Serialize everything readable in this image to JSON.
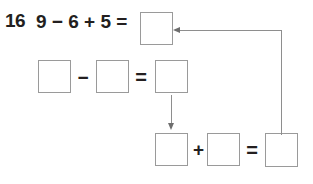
{
  "problem": {
    "number": "16",
    "equation_text": "9 − 6 + 5 =",
    "equation_plain": "9-6+5=",
    "operands": [
      9,
      6,
      5
    ],
    "operators": [
      "−",
      "+"
    ],
    "box_color": "#9a9a9a",
    "ink_color": "#231f20",
    "connector_color": "#8e8e8e"
  },
  "row1": {
    "label": "top-equation-row",
    "answer_box_value": "",
    "answer_box_placeholder": ""
  },
  "row2": {
    "label": "subtraction-step-row",
    "boxes": [
      {
        "name": "minuend",
        "value": ""
      },
      {
        "name": "subtrahend",
        "value": ""
      },
      {
        "name": "difference",
        "value": ""
      }
    ],
    "operator_minus": "−",
    "operator_equals": "="
  },
  "row3": {
    "label": "addition-step-row",
    "boxes": [
      {
        "name": "addend-1",
        "value": ""
      },
      {
        "name": "addend-2",
        "value": ""
      },
      {
        "name": "sum",
        "value": ""
      }
    ],
    "operator_plus": "+",
    "operator_equals": "="
  },
  "connectors": {
    "down_arrow_label": "difference-to-addend-arrow",
    "feedback_arrow_label": "sum-to-final-answer-arrow"
  }
}
